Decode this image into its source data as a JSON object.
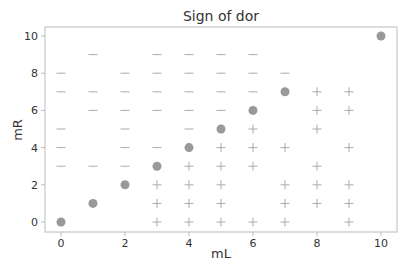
{
  "chart_data": {
    "type": "scatter",
    "title": "Sign of dor",
    "xlabel": "mL",
    "ylabel": "mR",
    "xlim": [
      -0.5,
      10.5
    ],
    "ylim": [
      -0.5,
      10.5
    ],
    "xticks": [
      0,
      2,
      4,
      6,
      8,
      10
    ],
    "yticks": [
      0,
      2,
      4,
      6,
      8,
      10
    ],
    "grid": false,
    "legend": null,
    "colors": {
      "marker": "#999999",
      "frame": "#bbbbbb",
      "text": "#333333"
    },
    "series": [
      {
        "name": "zero",
        "marker": "circle",
        "points": [
          [
            0,
            0
          ],
          [
            1,
            1
          ],
          [
            2,
            2
          ],
          [
            3,
            3
          ],
          [
            4,
            4
          ],
          [
            5,
            5
          ],
          [
            6,
            6
          ],
          [
            7,
            7
          ],
          [
            10,
            10
          ]
        ]
      },
      {
        "name": "negative",
        "marker": "minus",
        "points": [
          [
            0,
            3
          ],
          [
            0,
            4
          ],
          [
            0,
            5
          ],
          [
            0,
            7
          ],
          [
            0,
            8
          ],
          [
            1,
            3
          ],
          [
            1,
            6
          ],
          [
            1,
            7
          ],
          [
            1,
            9
          ],
          [
            2,
            3
          ],
          [
            2,
            4
          ],
          [
            2,
            5
          ],
          [
            2,
            6
          ],
          [
            2,
            7
          ],
          [
            2,
            8
          ],
          [
            3,
            4
          ],
          [
            3,
            6
          ],
          [
            3,
            7
          ],
          [
            3,
            8
          ],
          [
            3,
            9
          ],
          [
            4,
            5
          ],
          [
            4,
            6
          ],
          [
            4,
            7
          ],
          [
            4,
            8
          ],
          [
            4,
            9
          ],
          [
            5,
            6
          ],
          [
            5,
            7
          ],
          [
            5,
            8
          ],
          [
            5,
            9
          ],
          [
            6,
            7
          ],
          [
            6,
            8
          ],
          [
            6,
            9
          ],
          [
            7,
            8
          ]
        ]
      },
      {
        "name": "positive",
        "marker": "plus",
        "points": [
          [
            3,
            0
          ],
          [
            3,
            1
          ],
          [
            3,
            2
          ],
          [
            4,
            0
          ],
          [
            4,
            1
          ],
          [
            4,
            2
          ],
          [
            4,
            3
          ],
          [
            5,
            0
          ],
          [
            5,
            1
          ],
          [
            5,
            2
          ],
          [
            5,
            3
          ],
          [
            5,
            4
          ],
          [
            6,
            0
          ],
          [
            6,
            3
          ],
          [
            6,
            4
          ],
          [
            6,
            5
          ],
          [
            7,
            0
          ],
          [
            7,
            1
          ],
          [
            7,
            2
          ],
          [
            7,
            4
          ],
          [
            8,
            1
          ],
          [
            8,
            2
          ],
          [
            8,
            3
          ],
          [
            8,
            5
          ],
          [
            8,
            6
          ],
          [
            8,
            7
          ],
          [
            9,
            0
          ],
          [
            9,
            1
          ],
          [
            9,
            2
          ],
          [
            9,
            4
          ],
          [
            9,
            6
          ],
          [
            9,
            7
          ]
        ]
      }
    ]
  }
}
